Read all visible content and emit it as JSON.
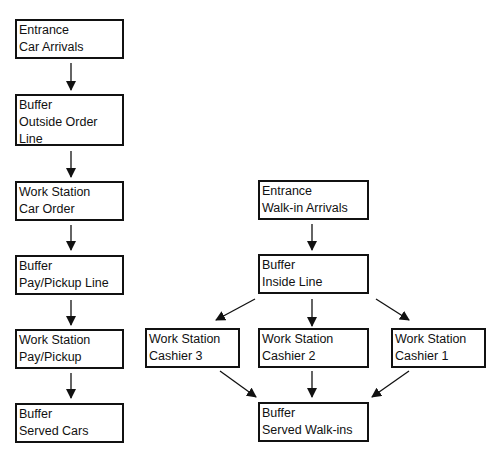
{
  "diagram": {
    "left_flow": [
      {
        "line1": "Entrance",
        "line2": "Car Arrivals"
      },
      {
        "line1": "Buffer",
        "line2": "Outside Order",
        "line3": "Line"
      },
      {
        "line1": "Work Station",
        "line2": "Car Order"
      },
      {
        "line1": "Buffer",
        "line2": "Pay/Pickup Line"
      },
      {
        "line1": "Work Station",
        "line2": "Pay/Pickup"
      },
      {
        "line1": "Buffer",
        "line2": "Served Cars"
      }
    ],
    "right_flow": {
      "entrance": {
        "line1": "Entrance",
        "line2": "Walk-in Arrivals"
      },
      "inside_line": {
        "line1": "Buffer",
        "line2": "Inside Line"
      },
      "cashier3": {
        "line1": "Work Station",
        "line2": "Cashier 3"
      },
      "cashier2": {
        "line1": "Work Station",
        "line2": "Cashier 2"
      },
      "cashier1": {
        "line1": "Work Station",
        "line2": "Cashier 1"
      },
      "served": {
        "line1": "Buffer",
        "line2": "Served Walk-ins"
      }
    }
  }
}
